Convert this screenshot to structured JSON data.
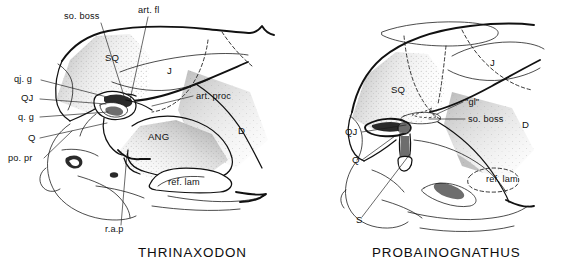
{
  "figure": {
    "title_visible": false,
    "background_color": "#ffffff",
    "ink_color": "#111111",
    "panels": [
      {
        "id": "left-panel",
        "taxon_name": "THRINAXODON",
        "taxon_label_position": {
          "x": 138,
          "y": 257
        },
        "labels": [
          {
            "key": "so-boss",
            "text": "so. boss",
            "x": 64,
            "y": 19,
            "anchor": "start",
            "leader": [
              [
                101,
                23
              ],
              [
                124,
                96
              ]
            ]
          },
          {
            "key": "art-fl",
            "text": "art. fl",
            "x": 138,
            "y": 13,
            "anchor": "start",
            "leader": [
              [
                148,
                17
              ],
              [
                130,
                100
              ]
            ]
          },
          {
            "key": "qj-g",
            "text": "qj. g",
            "x": 14,
            "y": 82,
            "anchor": "start",
            "leader": [
              [
                41,
                80
              ],
              [
                107,
                97
              ]
            ]
          },
          {
            "key": "QJ",
            "text": "QJ",
            "x": 21,
            "y": 101,
            "anchor": "start",
            "leader": [
              [
                40,
                99
              ],
              [
                106,
                104
              ]
            ]
          },
          {
            "key": "q-g",
            "text": "q. g",
            "x": 18,
            "y": 120,
            "anchor": "start",
            "leader": [
              [
                40,
                117
              ],
              [
                108,
                112
              ]
            ]
          },
          {
            "key": "Q",
            "text": "Q",
            "x": 28,
            "y": 141,
            "anchor": "start",
            "leader": [
              [
                40,
                138
              ],
              [
                107,
                123
              ]
            ]
          },
          {
            "key": "po-pr",
            "text": "po. pr",
            "x": 8,
            "y": 161,
            "anchor": "start",
            "leader": [
              [
                44,
                158
              ],
              [
                72,
                131
              ]
            ]
          },
          {
            "key": "art-proc",
            "text": "art. proc",
            "x": 196,
            "y": 99,
            "anchor": "start",
            "leader": [
              [
                193,
                96
              ],
              [
                152,
                106
              ]
            ]
          },
          {
            "key": "SQ",
            "text": "SQ",
            "x": 105,
            "y": 61,
            "anchor": "start"
          },
          {
            "key": "J",
            "text": "J",
            "x": 167,
            "y": 74,
            "anchor": "start"
          },
          {
            "key": "D",
            "text": "D",
            "x": 238,
            "y": 134,
            "anchor": "start"
          },
          {
            "key": "ANG",
            "text": "ANG",
            "x": 148,
            "y": 140,
            "anchor": "start"
          },
          {
            "key": "ref-lam",
            "text": "ref. lam",
            "x": 168,
            "y": 185,
            "anchor": "start"
          },
          {
            "key": "r-a-p",
            "text": "r.a.p",
            "x": 105,
            "y": 232,
            "anchor": "start",
            "leader": [
              [
                121,
                225
              ],
              [
                127,
                154
              ]
            ]
          }
        ]
      },
      {
        "id": "right-panel",
        "taxon_name": "PROBAINOGNATHUS",
        "taxon_label_position": {
          "x": 372,
          "y": 257
        },
        "labels": [
          {
            "key": "gl",
            "text": "\"gl\"",
            "x": 465,
            "y": 105,
            "anchor": "start",
            "leader": [
              [
                463,
                102
              ],
              [
                437,
                114
              ]
            ]
          },
          {
            "key": "so-boss",
            "text": "so. boss",
            "x": 468,
            "y": 122,
            "anchor": "start",
            "leader": [
              [
                465,
                119
              ],
              [
                429,
                119
              ]
            ]
          },
          {
            "key": "QJ",
            "text": "QJ",
            "x": 345,
            "y": 135,
            "anchor": "start",
            "leader": [
              [
                362,
                132
              ],
              [
                406,
                125
              ]
            ]
          },
          {
            "key": "Q",
            "text": "Q",
            "x": 352,
            "y": 163,
            "anchor": "start",
            "leader": [
              [
                362,
                160
              ],
              [
                395,
                136
              ]
            ]
          },
          {
            "key": "S",
            "text": "S",
            "x": 356,
            "y": 223,
            "anchor": "start",
            "leader": [
              [
                362,
                217
              ],
              [
                410,
                154
              ]
            ]
          },
          {
            "key": "SQ",
            "text": "SQ",
            "x": 391,
            "y": 93,
            "anchor": "start"
          },
          {
            "key": "J",
            "text": "J",
            "x": 490,
            "y": 66,
            "anchor": "start"
          },
          {
            "key": "D",
            "text": "D",
            "x": 522,
            "y": 128,
            "anchor": "start"
          },
          {
            "key": "ref-lam",
            "text": "ref. lam",
            "x": 486,
            "y": 182,
            "anchor": "start"
          }
        ]
      }
    ],
    "abbreviation_meanings_visible": false
  }
}
